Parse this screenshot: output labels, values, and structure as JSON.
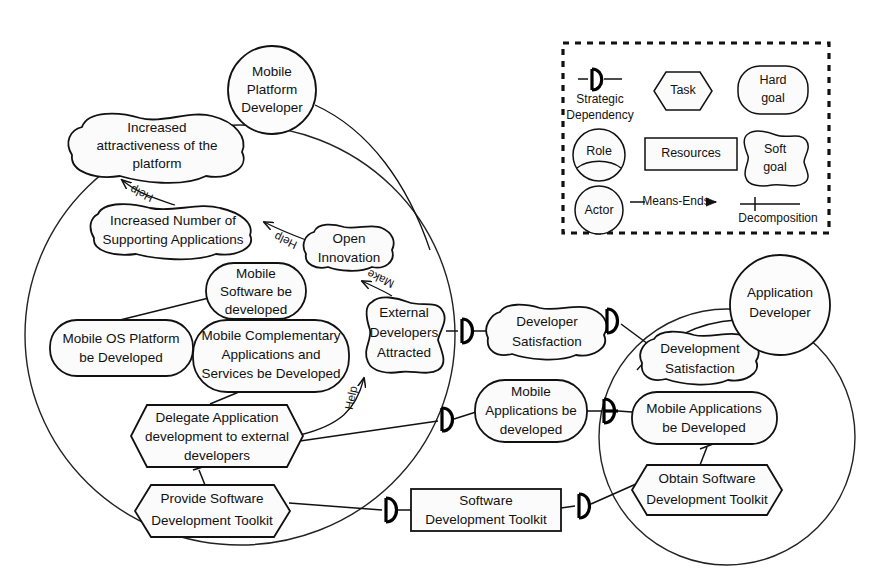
{
  "diagram": {
    "notation": "iStar",
    "background": "#ffffff",
    "stroke_color": "#111111",
    "node_fill": "#fbfbfb"
  },
  "actors": [
    {
      "id": "mobile-platform-developer",
      "label_lines": [
        "Mobile",
        "Platform",
        "Developer"
      ],
      "type": "actor",
      "cx": 272,
      "cy": 90,
      "r": 44
    },
    {
      "id": "application-developer",
      "label_lines": [
        "Application",
        "Developer"
      ],
      "type": "actor",
      "cx": 780,
      "cy": 305,
      "r": 50
    }
  ],
  "boundaries": [
    {
      "id": "mobile-platform-developer-boundary",
      "owner": "Mobile Platform Developer",
      "cx": 240,
      "cy": 335,
      "rx": 215,
      "ry": 210
    },
    {
      "id": "application-developer-boundary",
      "owner": "Application Developer",
      "cx": 727,
      "cy": 437,
      "rx": 128,
      "ry": 128
    }
  ],
  "nodes": [
    {
      "id": "increased-attractiveness",
      "type": "softgoal",
      "label_lines": [
        "Increased",
        "attractiveness of the",
        "platform"
      ],
      "x": 66,
      "y": 116,
      "w": 178,
      "h": 62
    },
    {
      "id": "increased-number-supporting-apps",
      "type": "softgoal",
      "label_lines": [
        "Increased Number of",
        "Supporting Applications"
      ],
      "x": 90,
      "y": 205,
      "w": 170,
      "h": 52
    },
    {
      "id": "open-innovation",
      "type": "softgoal",
      "label_lines": [
        "Open",
        "Innovation"
      ],
      "x": 307,
      "y": 225,
      "w": 82,
      "h": 54
    },
    {
      "id": "mobile-software-be-developed",
      "type": "hardgoal",
      "label_lines": [
        "Mobile",
        "Software be",
        "developed"
      ],
      "x": 206,
      "y": 263,
      "w": 100,
      "h": 56
    },
    {
      "id": "mobile-os-platform-be-developed",
      "type": "hardgoal",
      "label_lines": [
        "Mobile OS Platform",
        "be Developed"
      ],
      "x": 50,
      "y": 320,
      "w": 143,
      "h": 56
    },
    {
      "id": "mobile-complementary-apps",
      "type": "hardgoal",
      "label_lines": [
        "Mobile Complementary",
        "Applications and",
        "Services be Developed"
      ],
      "x": 193,
      "y": 320,
      "w": 156,
      "h": 72
    },
    {
      "id": "external-developers-attracted",
      "type": "softgoal",
      "label_lines": [
        "External",
        "Developers",
        "Attracted"
      ],
      "x": 364,
      "y": 295,
      "w": 82,
      "h": 80
    },
    {
      "id": "delegate-application-development",
      "type": "task",
      "label_lines": [
        "Delegate Application",
        "development to external",
        "developers"
      ],
      "x": 131,
      "y": 405,
      "w": 172,
      "h": 62
    },
    {
      "id": "provide-software-development-toolkit",
      "type": "task",
      "label_lines": [
        "Provide Software",
        "Development Toolkit"
      ],
      "x": 135,
      "y": 485,
      "w": 155,
      "h": 52
    },
    {
      "id": "developer-satisfaction",
      "type": "softgoal",
      "label_lines": [
        "Developer",
        "Satisfaction"
      ],
      "x": 491,
      "y": 303,
      "w": 112,
      "h": 58
    },
    {
      "id": "mobile-applications-be-developed-dep",
      "type": "hardgoal",
      "label_lines": [
        "Mobile",
        "Applications be",
        "developed"
      ],
      "x": 475,
      "y": 380,
      "w": 112,
      "h": 62
    },
    {
      "id": "software-development-toolkit",
      "type": "resource",
      "label_lines": [
        "Software",
        "Development Toolkit"
      ],
      "x": 411,
      "y": 489,
      "w": 150,
      "h": 42
    },
    {
      "id": "development-satisfaction",
      "type": "softgoal",
      "label_lines": [
        "Development",
        "Satisfaction"
      ],
      "x": 645,
      "y": 330,
      "w": 112,
      "h": 56
    },
    {
      "id": "mobile-applications-be-developed",
      "type": "hardgoal",
      "label_lines": [
        "Mobile Applications",
        "be Developed"
      ],
      "x": 632,
      "y": 392,
      "w": 145,
      "h": 52
    },
    {
      "id": "obtain-software-development-toolkit",
      "type": "task",
      "label_lines": [
        "Obtain Software",
        "Development Toolkit"
      ],
      "x": 632,
      "y": 465,
      "w": 150,
      "h": 50
    }
  ],
  "contribution_links": [
    {
      "id": "help-supporting-apps-to-attractiveness",
      "label": "Help",
      "from": "increased-number-supporting-apps",
      "to": "increased-attractiveness",
      "x": 133,
      "y": 190
    },
    {
      "id": "help-open-innovation-to-supporting-apps",
      "label": "Help",
      "from": "open-innovation",
      "to": "increased-number-supporting-apps",
      "x": 280,
      "y": 240
    },
    {
      "id": "make-external-devs-to-open-innovation",
      "label": "Make",
      "from": "external-developers-attracted",
      "to": "open-innovation",
      "x": 375,
      "y": 275
    },
    {
      "id": "help-delegate-to-external-devs",
      "label": "Help",
      "from": "delegate-application-development",
      "to": "external-developers-attracted",
      "x": 355,
      "y": 400
    }
  ],
  "dependency_links": [
    {
      "id": "dep-external-devs-developer-satisfaction",
      "from": "external-developers-attracted",
      "to": "developer-satisfaction",
      "glyph_x": 466,
      "glyph_y": 331
    },
    {
      "id": "dep-developer-satisfaction-development-satisfaction",
      "from": "developer-satisfaction",
      "to": "development-satisfaction",
      "glyph_x": 613,
      "glyph_y": 320
    },
    {
      "id": "dep-delegate-mobile-applications",
      "from": "delegate-application-development",
      "to": "mobile-applications-be-developed-dep",
      "glyph_x": 446,
      "glyph_y": 419
    },
    {
      "id": "dep-mobile-applications-to-developed",
      "from": "mobile-applications-be-developed-dep",
      "to": "mobile-applications-be-developed",
      "glyph_x": 610,
      "glyph_y": 410
    },
    {
      "id": "dep-provide-toolkit-software-toolkit",
      "from": "provide-software-development-toolkit",
      "to": "software-development-toolkit",
      "glyph_x": 390,
      "glyph_y": 510
    },
    {
      "id": "dep-software-toolkit-obtain-toolkit",
      "from": "software-development-toolkit",
      "to": "obtain-software-development-toolkit",
      "glyph_x": 583,
      "glyph_y": 505
    }
  ],
  "means_ends_links": [
    {
      "id": "me-mobile-os-platform-to-software",
      "from": "mobile-os-platform-be-developed",
      "to": "mobile-software-be-developed"
    },
    {
      "id": "me-complementary-apps-to-software",
      "from": "mobile-complementary-apps",
      "to": "mobile-software-be-developed"
    },
    {
      "id": "me-delegate-to-complementary-apps",
      "from": "delegate-application-development",
      "to": "mobile-complementary-apps"
    }
  ],
  "decomposition_links": [
    {
      "id": "dec-provide-toolkit-to-delegate",
      "from": "provide-software-development-toolkit",
      "to": "delegate-application-development"
    },
    {
      "id": "dec-obtain-toolkit-to-mobile-apps",
      "from": "obtain-software-development-toolkit",
      "to": "mobile-applications-be-developed"
    }
  ],
  "legend": {
    "id": "legend-panel",
    "border_style": "dashed",
    "x": 563,
    "y": 43,
    "w": 266,
    "h": 190,
    "items": [
      {
        "id": "legend-strategic-dependency",
        "shape": "dependency-line",
        "label_lines": [
          "Strategic",
          "Dependency"
        ]
      },
      {
        "id": "legend-task",
        "shape": "hexagon",
        "label_lines": [
          "Task"
        ]
      },
      {
        "id": "legend-hard-goal",
        "shape": "rounded-rect",
        "label_lines": [
          "Hard",
          "goal"
        ]
      },
      {
        "id": "legend-role",
        "shape": "circle-with-arc",
        "label_lines": [
          "Role"
        ]
      },
      {
        "id": "legend-resources",
        "shape": "rectangle",
        "label_lines": [
          "Resources"
        ]
      },
      {
        "id": "legend-soft-goal",
        "shape": "cloud",
        "label_lines": [
          "Soft",
          "goal"
        ]
      },
      {
        "id": "legend-actor",
        "shape": "circle",
        "label_lines": [
          "Actor"
        ]
      },
      {
        "id": "legend-means-ends",
        "shape": "arrow-line",
        "label_lines": [
          "Means-Ends"
        ]
      },
      {
        "id": "legend-decomposition",
        "shape": "tick-line",
        "label_lines": [
          "Decomposition"
        ]
      }
    ]
  }
}
